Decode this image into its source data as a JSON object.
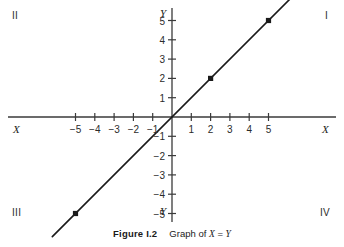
{
  "figure": {
    "caption_number": "Figure I.2",
    "caption_text_pre": "Graph of ",
    "caption_var_x": "X",
    "caption_eq": " = ",
    "caption_var_y": "Y"
  },
  "axes": {
    "x_label_left": "X",
    "x_label_right": "X",
    "y_label_top": "Y",
    "y_label_bottom": "Y",
    "axis_color": "#3a3a3a",
    "line_color": "#1a1a1a"
  },
  "quadrants": [
    {
      "name": "quadrant-1",
      "label": "I"
    },
    {
      "name": "quadrant-2",
      "label": "II"
    },
    {
      "name": "quadrant-3",
      "label": "III"
    },
    {
      "name": "quadrant-4",
      "label": "IV"
    }
  ],
  "chart_data": {
    "type": "line",
    "title": "Graph of X = Y",
    "xlabel": "X",
    "ylabel": "Y",
    "grid": false,
    "legend": "none",
    "xlim": [
      -6.3,
      6.3
    ],
    "ylim": [
      -6.3,
      6.3
    ],
    "xticks": [
      -5,
      -4,
      -3,
      -2,
      -1,
      1,
      2,
      3,
      4,
      5
    ],
    "yticks": [
      5,
      4,
      3,
      2,
      1,
      -1,
      -2,
      -3,
      -4,
      -5
    ],
    "xtick_labels": [
      "−5",
      "−4",
      "−3",
      "−2",
      "−1",
      "1",
      "2",
      "3",
      "4",
      "5"
    ],
    "ytick_labels": [
      "5",
      "4",
      "3",
      "2",
      "1",
      "−1",
      "−2",
      "−3",
      "−4",
      "−5"
    ],
    "series": [
      {
        "name": "X = Y",
        "equation": "X = Y",
        "slope": 1,
        "intercept": 0,
        "x": [
          -6.2,
          6.2
        ],
        "y": [
          -6.2,
          6.2
        ],
        "markers": [
          {
            "x": -5,
            "y": -5
          },
          {
            "x": 2,
            "y": 2
          },
          {
            "x": 5,
            "y": 5
          }
        ]
      }
    ]
  }
}
